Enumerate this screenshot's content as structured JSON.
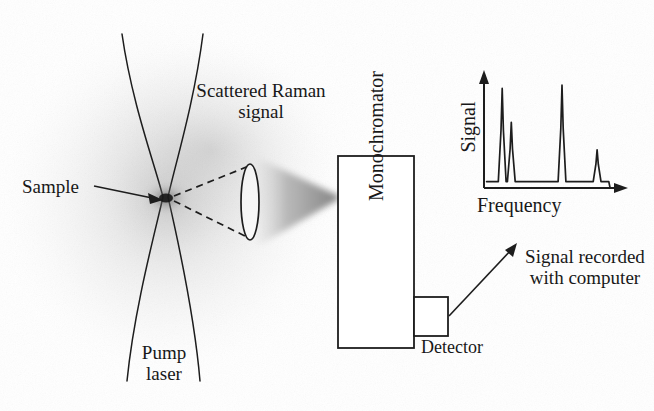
{
  "figure": {
    "background_color": "#ffffff",
    "ink_color": "#181818",
    "haze_color": "#c9c9c9"
  },
  "labels": {
    "sample": "Sample",
    "pump_laser": "Pump\nlaser",
    "scattered_raman": "Scattered Raman\nsignal",
    "monochromator": "Monochromator",
    "detector": "Detector",
    "signal_recorded": "Signal recorded\nwith computer"
  },
  "components": {
    "pump_beam": {
      "name": "pump-laser-beam",
      "waist_x": 165,
      "waist_y": 198,
      "top_half_width": 41,
      "bottom_half_width": 37
    },
    "sample_point": {
      "name": "sample-focus",
      "x": 165,
      "y": 198
    },
    "collection_lens": {
      "name": "collection-lens",
      "cx": 250,
      "cy": 202,
      "rx": 9,
      "ry": 38
    },
    "collection_cone": {
      "name": "dashed-collection-cone",
      "apex_x": 171,
      "apex_y": 199
    },
    "focused_beam": {
      "name": "focused-signal-beam",
      "from_x": 258,
      "to_x": 338,
      "to_y": 197
    },
    "monochromator_box": {
      "name": "monochromator-box",
      "x": 338,
      "y": 156,
      "width": 76,
      "height": 192
    },
    "detector_box": {
      "name": "detector-box",
      "x": 414,
      "y": 297,
      "width": 34,
      "height": 39
    },
    "signal_arrow": {
      "name": "detector-to-plot-arrow",
      "from_x": 450,
      "from_y": 315,
      "to_x": 512,
      "to_y": 243
    }
  },
  "chart_data": {
    "type": "line",
    "title": "",
    "xlabel": "Frequency",
    "ylabel": "Signal",
    "grid": false,
    "legend": null,
    "xlim": [
      0,
      100
    ],
    "ylim": [
      0,
      100
    ],
    "axis_origin_px": {
      "x": 484,
      "y": 188
    },
    "axis_x_end_px": 628,
    "axis_y_top_px": 72,
    "baseline_level": 6,
    "series": [
      {
        "name": "Raman spectrum",
        "peaks": [
          {
            "index": 1,
            "x": 14,
            "height": 94,
            "half_width": 3
          },
          {
            "index": 2,
            "x": 21,
            "height": 62,
            "half_width": 3
          },
          {
            "index": 3,
            "x": 60,
            "height": 97,
            "half_width": 3
          },
          {
            "index": 4,
            "x": 87,
            "height": 36,
            "half_width": 3
          }
        ]
      }
    ]
  }
}
